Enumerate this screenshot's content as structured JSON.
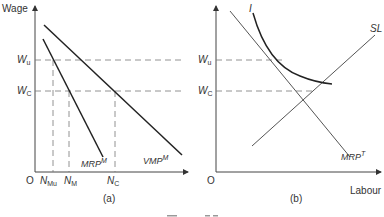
{
  "figure": {
    "caption_partial": "Figure 7.7"
  },
  "panel_a": {
    "caption": "(a)",
    "y_axis_label": "Wage",
    "origin": "O",
    "wage_levels": [
      {
        "main": "W",
        "sub": "u"
      },
      {
        "main": "W",
        "sub": "C"
      }
    ],
    "employment_levels": [
      {
        "main": "N",
        "sub": "Mu"
      },
      {
        "main": "N",
        "sub": "M"
      },
      {
        "main": "N",
        "sub": "C"
      }
    ],
    "curves": [
      {
        "main": "VMP",
        "sup": "M"
      },
      {
        "main": "MRP",
        "sup": "M"
      }
    ]
  },
  "panel_b": {
    "caption": "(b)",
    "x_axis_label": "Labour",
    "origin": "O",
    "wage_levels": [
      {
        "main": "W",
        "sub": "u"
      },
      {
        "main": "W",
        "sub": "C"
      }
    ],
    "curves": [
      {
        "main": "MRP",
        "sup": "T"
      },
      {
        "main": "SL"
      },
      {
        "main": "I"
      }
    ]
  },
  "colors": {
    "line": "#222222",
    "thin_line": "#555555",
    "dashed": "#777777",
    "text": "#333333"
  }
}
